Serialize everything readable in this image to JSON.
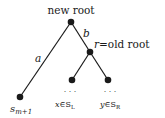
{
  "diagram": {
    "type": "tree",
    "nodes": [
      {
        "id": "new_root",
        "label": "new root",
        "x": 71,
        "y": 22
      },
      {
        "id": "old_root",
        "label": "r=old root",
        "x": 90,
        "y": 52
      },
      {
        "id": "s_m1",
        "label": "s",
        "sub": "m+1",
        "x": 20,
        "y": 97
      },
      {
        "id": "x",
        "label": "x∈S",
        "sub": "L",
        "x": 72,
        "y": 80
      },
      {
        "id": "y",
        "label": "y∈S",
        "sub": "R",
        "x": 108,
        "y": 80
      }
    ],
    "edges": [
      {
        "from": "new_root",
        "to": "s_m1",
        "label": "a"
      },
      {
        "from": "new_root",
        "to": "old_root",
        "label": "b"
      },
      {
        "from": "old_root",
        "to": "x",
        "label": ""
      },
      {
        "from": "old_root",
        "to": "y",
        "label": ""
      }
    ],
    "labels": {
      "new_root": "new root",
      "r_var": "r",
      "old_root": "=old root",
      "edge_a": "a",
      "edge_b": "b",
      "s": "s",
      "s_sub": "m+1",
      "x_var": "x",
      "x_in": "∈S",
      "x_sub": "L",
      "y_var": "y",
      "y_in": "∈S",
      "y_sub": "R",
      "ellipsis": "· · ·"
    }
  }
}
